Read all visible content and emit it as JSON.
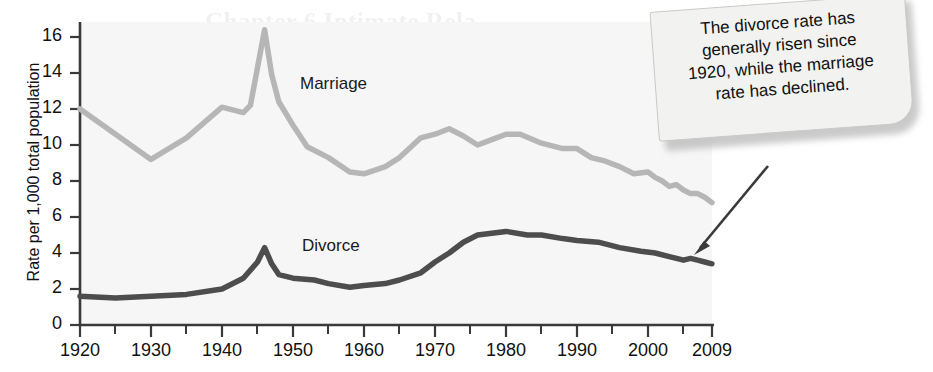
{
  "chart_data": {
    "type": "line",
    "title": "",
    "xlabel": "",
    "ylabel": "Rate per 1,000 total population",
    "xlim": [
      1920,
      2009
    ],
    "ylim": [
      0,
      17
    ],
    "yticks": [
      0,
      2,
      4,
      6,
      8,
      10,
      12,
      14,
      16
    ],
    "xticks": [
      1920,
      1930,
      1940,
      1950,
      1960,
      1970,
      1980,
      1990,
      2000,
      2009
    ],
    "xtick_labels": [
      "1920",
      "1930",
      "1940",
      "1950",
      "1960",
      "1970",
      "1980",
      "1990",
      "2000",
      "2009"
    ],
    "minor_xticks": [
      1925,
      1935,
      1945,
      1955,
      1965,
      1975,
      1985,
      1995,
      2005
    ],
    "grid": false,
    "legend_position": "inline-labels",
    "series": [
      {
        "name": "Marriage",
        "color": "#b5b5b5",
        "label_x": 1951,
        "label_y": 13.5,
        "x": [
          1920,
          1925,
          1930,
          1935,
          1940,
          1943,
          1944,
          1946,
          1947,
          1948,
          1950,
          1952,
          1955,
          1958,
          1960,
          1963,
          1965,
          1968,
          1970,
          1972,
          1974,
          1976,
          1978,
          1980,
          1982,
          1985,
          1988,
          1990,
          1992,
          1994,
          1996,
          1998,
          2000,
          2001,
          2002,
          2003,
          2004,
          2005,
          2006,
          2007,
          2008,
          2009
        ],
        "y": [
          12.0,
          10.6,
          9.2,
          10.4,
          12.1,
          11.8,
          12.2,
          16.4,
          13.9,
          12.4,
          11.1,
          9.9,
          9.3,
          8.5,
          8.4,
          8.8,
          9.3,
          10.4,
          10.6,
          10.9,
          10.5,
          10.0,
          10.3,
          10.6,
          10.6,
          10.1,
          9.8,
          9.8,
          9.3,
          9.1,
          8.8,
          8.4,
          8.5,
          8.2,
          8.0,
          7.7,
          7.8,
          7.5,
          7.3,
          7.3,
          7.1,
          6.8
        ],
        "points_note": "Peak 16.4 in 1946; general decline after 1980"
      },
      {
        "name": "Divorce",
        "color": "#4d4d4d",
        "label_x": 1951,
        "label_y": 4.6,
        "x": [
          1920,
          1925,
          1930,
          1935,
          1940,
          1943,
          1945,
          1946,
          1947,
          1948,
          1950,
          1953,
          1955,
          1958,
          1960,
          1963,
          1965,
          1968,
          1970,
          1972,
          1974,
          1976,
          1978,
          1980,
          1983,
          1985,
          1988,
          1990,
          1993,
          1996,
          1999,
          2001,
          2003,
          2005,
          2006,
          2007,
          2008,
          2009
        ],
        "y": [
          1.6,
          1.5,
          1.6,
          1.7,
          2.0,
          2.6,
          3.5,
          4.3,
          3.4,
          2.8,
          2.6,
          2.5,
          2.3,
          2.1,
          2.2,
          2.3,
          2.5,
          2.9,
          3.5,
          4.0,
          4.6,
          5.0,
          5.1,
          5.2,
          5.0,
          5.0,
          4.8,
          4.7,
          4.6,
          4.3,
          4.1,
          4.0,
          3.8,
          3.6,
          3.7,
          3.6,
          3.5,
          3.4
        ],
        "points_note": "Peak 4.3 in 1946; rise to ~5.2 around 1980, then gradual decline"
      }
    ],
    "annotation": {
      "lines": [
        "The divorce rate has",
        "generally risen since",
        "1920, while the marriage",
        "rate has declined."
      ],
      "arrow_target_year": 2006,
      "arrow_target_value": 3.7
    }
  },
  "background_showthrough": {
    "title": "Chapter 6 Intimate Rela",
    "lines": [
      "tionships in the",
      "than there were",
      "family forms"
    ]
  }
}
